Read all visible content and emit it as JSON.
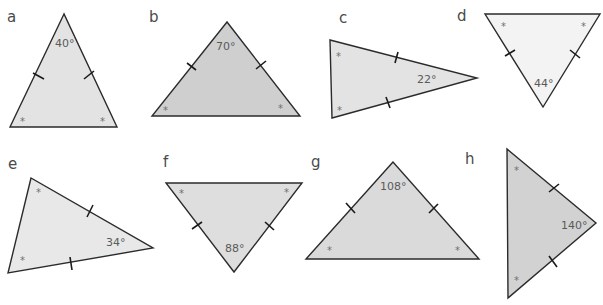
{
  "colors": {
    "stroke": "#2b2b2b",
    "fill_light": "#ebebeb",
    "fill_mid": "#dcdcdc",
    "fill_dark": "#cfcfcf",
    "text": "#4a4a4a"
  },
  "star_symbol": "*",
  "triangles": [
    {
      "label": "a",
      "angle": "40°",
      "angle_position": "apex",
      "equal_angle_marks": 2,
      "equal_side_ticks": 2
    },
    {
      "label": "b",
      "angle": "70°",
      "angle_position": "apex",
      "equal_angle_marks": 2,
      "equal_side_ticks": 2
    },
    {
      "label": "c",
      "angle": "22°",
      "angle_position": "apex",
      "equal_angle_marks": 2,
      "equal_side_ticks": 2
    },
    {
      "label": "d",
      "angle": "44°",
      "angle_position": "apex",
      "equal_angle_marks": 2,
      "equal_side_ticks": 2
    },
    {
      "label": "e",
      "angle": "34°",
      "angle_position": "apex",
      "equal_angle_marks": 2,
      "equal_side_ticks": 2
    },
    {
      "label": "f",
      "angle": "88°",
      "angle_position": "apex",
      "equal_angle_marks": 2,
      "equal_side_ticks": 2
    },
    {
      "label": "g",
      "angle": "108°",
      "angle_position": "apex",
      "equal_angle_marks": 2,
      "equal_side_ticks": 2
    },
    {
      "label": "h",
      "angle": "140°",
      "angle_position": "apex",
      "equal_angle_marks": 2,
      "equal_side_ticks": 2
    }
  ]
}
